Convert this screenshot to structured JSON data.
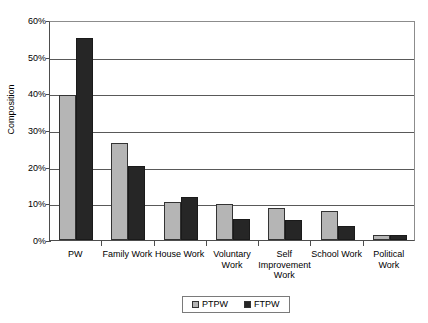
{
  "chart_data": {
    "type": "bar",
    "title": "",
    "xlabel": "",
    "ylabel": "Composition",
    "ylim": [
      0,
      60
    ],
    "ytick_labels": [
      "60%",
      "50%",
      "40%",
      "30%",
      "20%",
      "10%",
      "0%"
    ],
    "ytick_values": [
      60,
      50,
      40,
      30,
      20,
      10,
      0
    ],
    "grid": true,
    "legend_position": "bottom",
    "categories": [
      "PW",
      "Family Work",
      "House Work",
      "Voluntary Work",
      "Self Improvement Work",
      "School Work",
      "Political Work"
    ],
    "series": [
      {
        "name": "PTPW",
        "color": "#b5b5b5",
        "values": [
          39.5,
          26.5,
          10.3,
          9.7,
          8.8,
          7.8,
          1.3
        ]
      },
      {
        "name": "FTPW",
        "color": "#262626",
        "values": [
          55.0,
          20.2,
          11.7,
          5.6,
          5.4,
          3.9,
          1.4
        ]
      }
    ]
  },
  "legend": {
    "entries": [
      {
        "label": "PTPW",
        "color": "#b5b5b5"
      },
      {
        "label": "FTPW",
        "color": "#262626"
      }
    ]
  }
}
